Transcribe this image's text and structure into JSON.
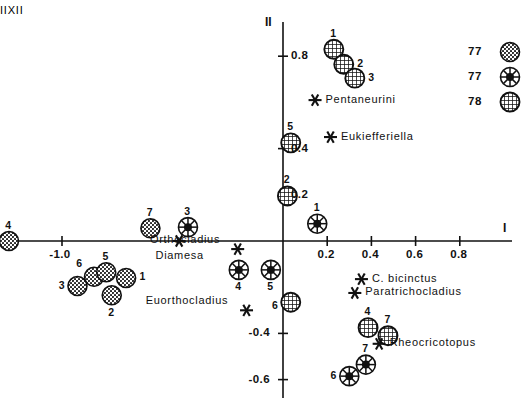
{
  "chart_data": {
    "type": "scatter",
    "title": "",
    "xlabel": "I",
    "ylabel": "II",
    "xlim": [
      -1.35,
      1.0
    ],
    "ylim": [
      -0.78,
      0.98
    ],
    "grid": false,
    "legend_position": "top-right",
    "xticks": [
      -1.0,
      0.2,
      0.4,
      0.6,
      0.8
    ],
    "xtick_labels": [
      "-1.0",
      "0.2",
      "0.4",
      "0.6",
      "0.8"
    ],
    "yticks": [
      0.8,
      0.4,
      0.2,
      -0.4,
      -0.6
    ],
    "ytick_labels": [
      "0.8",
      "0.4",
      "0.2",
      "-0.4",
      "-0.6"
    ],
    "series": [
      {
        "name": "II 77",
        "marker": "stippled-circle",
        "points": [
          {
            "label": "4",
            "x": -1.24,
            "y": 0.0,
            "label_pos": "above"
          },
          {
            "label": "7",
            "x": -0.6,
            "y": 0.055,
            "label_pos": "above"
          },
          {
            "label": "3",
            "x": -0.93,
            "y": -0.195,
            "label_pos": "left"
          },
          {
            "label": "6",
            "x": -0.855,
            "y": -0.155,
            "label_pos": "above-left"
          },
          {
            "label": "5",
            "x": -0.8,
            "y": -0.135,
            "label_pos": "above"
          },
          {
            "label": "1",
            "x": -0.71,
            "y": -0.16,
            "label_pos": "right"
          },
          {
            "label": "2",
            "x": -0.775,
            "y": -0.235,
            "label_pos": "below"
          }
        ]
      },
      {
        "name": "XI 77",
        "marker": "dot-circle",
        "points": [
          {
            "label": "3",
            "x": -0.43,
            "y": 0.06,
            "label_pos": "above"
          },
          {
            "label": "1",
            "x": 0.155,
            "y": 0.075,
            "label_pos": "above"
          },
          {
            "label": "4",
            "x": -0.2,
            "y": -0.125,
            "label_pos": "below"
          },
          {
            "label": "5",
            "x": -0.055,
            "y": -0.125,
            "label_pos": "below"
          },
          {
            "label": "6",
            "x": 0.3,
            "y": -0.585,
            "label_pos": "left"
          },
          {
            "label": "7",
            "x": 0.375,
            "y": -0.535,
            "label_pos": "above"
          }
        ]
      },
      {
        "name": "I 78",
        "marker": "hatched-circle",
        "points": [
          {
            "label": "1",
            "x": 0.23,
            "y": 0.83,
            "label_pos": "above"
          },
          {
            "label": "2",
            "x": 0.275,
            "y": 0.765,
            "label_pos": "right"
          },
          {
            "label": "3",
            "x": 0.325,
            "y": 0.705,
            "label_pos": "right"
          },
          {
            "label": "5",
            "x": 0.035,
            "y": 0.425,
            "label_pos": "above"
          },
          {
            "label": "2",
            "x": 0.02,
            "y": 0.195,
            "label_pos": "above"
          },
          {
            "label": "6",
            "x": 0.035,
            "y": -0.265,
            "label_pos": "below-left"
          },
          {
            "label": "4",
            "x": 0.385,
            "y": -0.375,
            "label_pos": "above"
          },
          {
            "label": "7",
            "x": 0.475,
            "y": -0.41,
            "label_pos": "above"
          }
        ]
      },
      {
        "name": "taxa",
        "marker": "asterisk",
        "points": [
          {
            "label": "Pentaneurini",
            "x": 0.145,
            "y": 0.61,
            "label_pos": "right"
          },
          {
            "label": "Eukiefferiella",
            "x": 0.215,
            "y": 0.45,
            "label_pos": "right"
          },
          {
            "label": "Diamesa",
            "x": -0.47,
            "y": 0.0,
            "label_pos": "below"
          },
          {
            "label": "Orthocladius",
            "x": -0.205,
            "y": -0.035,
            "label_pos": "above-left"
          },
          {
            "label": "C. bicinctus",
            "x": 0.355,
            "y": -0.165,
            "label_pos": "right"
          },
          {
            "label": "Paratrichocladius",
            "x": 0.325,
            "y": -0.225,
            "label_pos": "right"
          },
          {
            "label": "Euorthocladius",
            "x": -0.165,
            "y": -0.3,
            "label_pos": "above-left"
          },
          {
            "label": "Rheocricotopus",
            "x": 0.435,
            "y": -0.445,
            "label_pos": "right"
          }
        ]
      }
    ],
    "legend": [
      {
        "code": "II",
        "year": "77",
        "marker": "stippled-circle"
      },
      {
        "code": "XI",
        "year": "77",
        "marker": "dot-circle"
      },
      {
        "code": "I",
        "year": "78",
        "marker": "hatched-circle"
      }
    ]
  }
}
